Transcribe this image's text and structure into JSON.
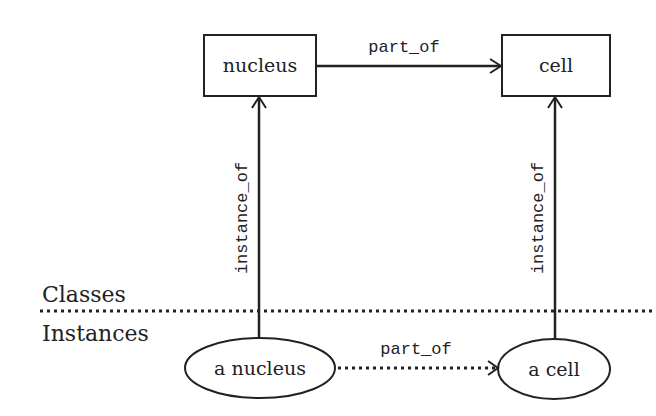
{
  "diagram": {
    "levels": {
      "upper_label": "Classes",
      "lower_label": "Instances"
    },
    "nodes": {
      "class_nucleus": {
        "label": "nucleus",
        "shape": "rectangle"
      },
      "class_cell": {
        "label": "cell",
        "shape": "rectangle"
      },
      "instance_nucleus": {
        "label": "a nucleus",
        "shape": "ellipse"
      },
      "instance_cell": {
        "label": "a cell",
        "shape": "ellipse"
      }
    },
    "edges": {
      "class_part_of": {
        "label": "part_of",
        "from": "nucleus",
        "to": "cell",
        "style": "solid"
      },
      "instance_part_of": {
        "label": "part_of",
        "from": "a nucleus",
        "to": "a cell",
        "style": "dotted"
      },
      "nucleus_instance_of": {
        "label": "instance_of",
        "from": "a nucleus",
        "to": "nucleus",
        "style": "solid"
      },
      "cell_instance_of": {
        "label": "instance_of",
        "from": "a cell",
        "to": "cell",
        "style": "solid"
      }
    },
    "colors": {
      "stroke": "#222222",
      "background": "#ffffff"
    }
  }
}
